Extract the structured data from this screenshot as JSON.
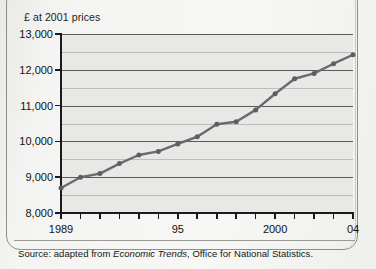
{
  "chart_data": {
    "type": "line",
    "title": "£ at 2001 prices",
    "xlabel": "",
    "ylabel": "£ at 2001 prices",
    "x": [
      1989,
      1990,
      1991,
      1992,
      1993,
      1994,
      1995,
      1996,
      1997,
      1998,
      1999,
      2000,
      2001,
      2002,
      2003,
      2004
    ],
    "values": [
      8700,
      9000,
      9100,
      9380,
      9620,
      9720,
      9930,
      10130,
      10480,
      10550,
      10880,
      11330,
      11750,
      11900,
      12170,
      12420
    ],
    "series": [
      {
        "name": "Real household disposable income per head",
        "values": [
          8700,
          9000,
          9100,
          9380,
          9620,
          9720,
          9930,
          10130,
          10480,
          10550,
          10880,
          11330,
          11750,
          11900,
          12170,
          12420
        ]
      }
    ],
    "ylim": [
      8000,
      13000
    ],
    "xlim": [
      1989,
      2004
    ],
    "ytick_labels": [
      "8,000",
      "9,000",
      "10,000",
      "11,000",
      "12,000",
      "13,000"
    ],
    "ytick_values": [
      8000,
      9000,
      10000,
      11000,
      12000,
      13000
    ],
    "xtick_values": [
      1989,
      1990,
      1991,
      1992,
      1993,
      1994,
      1995,
      1996,
      1997,
      1998,
      1999,
      2000,
      2001,
      2002,
      2003,
      2004
    ],
    "xtick_labels": [
      "1989",
      "",
      "",
      "",
      "",
      "",
      "95",
      "",
      "",
      "",
      "",
      "2000",
      "",
      "",
      "",
      "04"
    ],
    "grid": true,
    "legend": "none",
    "line_color": "#6b6b6b",
    "marker_color": "#5e5e5e",
    "plot_bg_color": "#e8e8e6",
    "axis_color": "#1a1a1a"
  },
  "source": {
    "prefix": "Source: adapted from ",
    "italic": "Economic Trends",
    "suffix": ", Office for National Statistics."
  }
}
